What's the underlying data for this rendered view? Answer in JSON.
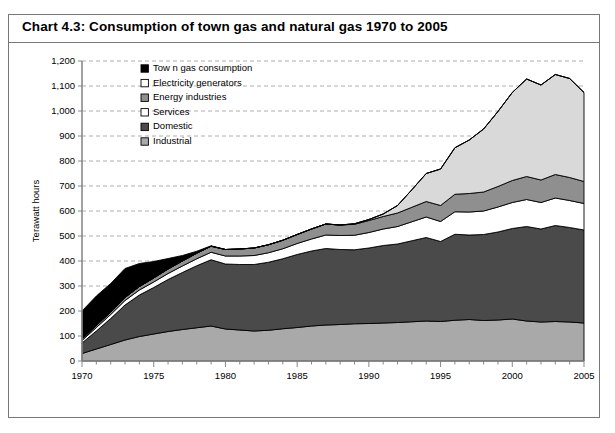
{
  "title": "Chart 4.3:  Consumption of town gas and natural gas 1970 to 2005",
  "legend": {
    "items": [
      {
        "label": "Tow n gas consumption",
        "color": "#000000",
        "name": "town-gas-consumption"
      },
      {
        "label": "Electricity generators",
        "color": "#ffffff",
        "name": "electricity-generators"
      },
      {
        "label": "Energy industries",
        "color": "#8f8f8f",
        "name": "energy-industries"
      },
      {
        "label": "Services",
        "color": "#ffffff",
        "name": "services"
      },
      {
        "label": "Domestic",
        "color": "#4a4a4a",
        "name": "domestic"
      },
      {
        "label": "Industrial",
        "color": "#a9a9a9",
        "name": "industrial"
      }
    ]
  },
  "chart_data": {
    "type": "area",
    "stacked": true,
    "title": "Chart 4.3:  Consumption of town gas and natural gas 1970 to 2005",
    "xlabel": "",
    "ylabel": "Terawatt hours",
    "ylim": [
      0,
      1200
    ],
    "ytick_step": 100,
    "yticks": [
      "0",
      "100",
      "200",
      "300",
      "400",
      "500",
      "600",
      "700",
      "800",
      "900",
      "1,000",
      "1,100",
      "1,200"
    ],
    "xlim": [
      1970,
      2005
    ],
    "xticks": [
      "1970",
      "1975",
      "1980",
      "1985",
      "1990",
      "1995",
      "2000",
      "2005"
    ],
    "xtick_step": 5,
    "grid": "horizontal-dashed",
    "legend_position": "upper-left-inside",
    "x": [
      1970,
      1971,
      1972,
      1973,
      1974,
      1975,
      1976,
      1977,
      1978,
      1979,
      1980,
      1981,
      1982,
      1983,
      1984,
      1985,
      1986,
      1987,
      1988,
      1989,
      1990,
      1991,
      1992,
      1993,
      1994,
      1995,
      1996,
      1997,
      1998,
      1999,
      2000,
      2001,
      2002,
      2003,
      2004,
      2005
    ],
    "series": [
      {
        "name": "Industrial",
        "color": "#a9a9a9",
        "stack_order": 1,
        "values": [
          30,
          48,
          66,
          84,
          98,
          108,
          118,
          126,
          133,
          140,
          128,
          124,
          120,
          123,
          129,
          134,
          140,
          144,
          146,
          149,
          150,
          152,
          154,
          157,
          160,
          158,
          163,
          166,
          162,
          164,
          168,
          160,
          156,
          158,
          156,
          152
        ]
      },
      {
        "name": "Domestic",
        "color": "#4a4a4a",
        "stack_order": 2,
        "values": [
          42,
          72,
          104,
          140,
          166,
          186,
          208,
          228,
          248,
          265,
          260,
          262,
          266,
          272,
          280,
          292,
          300,
          306,
          300,
          296,
          302,
          310,
          314,
          324,
          334,
          320,
          344,
          338,
          344,
          352,
          362,
          378,
          372,
          384,
          378,
          372
        ]
      },
      {
        "name": "Services",
        "color": "#ffffff",
        "stack_order": 3,
        "values": [
          10,
          14,
          16,
          18,
          20,
          22,
          24,
          26,
          28,
          30,
          32,
          34,
          36,
          38,
          40,
          44,
          48,
          54,
          56,
          58,
          62,
          66,
          70,
          76,
          82,
          80,
          90,
          92,
          94,
          100,
          104,
          108,
          106,
          110,
          108,
          106
        ]
      },
      {
        "name": "Energy industries",
        "color": "#8f8f8f",
        "stack_order": 4,
        "values": [
          6,
          8,
          10,
          12,
          14,
          16,
          18,
          20,
          22,
          24,
          26,
          28,
          30,
          32,
          34,
          36,
          40,
          44,
          42,
          44,
          48,
          50,
          54,
          58,
          62,
          64,
          70,
          74,
          76,
          82,
          88,
          92,
          90,
          94,
          92,
          88
        ]
      },
      {
        "name": "Electricity generators",
        "color": "#d9d9d9",
        "stack_order": 5,
        "values": [
          0,
          0,
          0,
          0,
          0,
          0,
          0,
          0,
          0,
          0,
          0,
          0,
          0,
          0,
          0,
          0,
          0,
          0,
          0,
          2,
          4,
          10,
          30,
          70,
          112,
          146,
          186,
          214,
          252,
          300,
          352,
          390,
          380,
          400,
          396,
          356
        ]
      },
      {
        "name": "Town gas consumption",
        "color": "#000000",
        "stack_order": 6,
        "values": [
          112,
          118,
          114,
          116,
          92,
          66,
          42,
          22,
          8,
          2,
          0,
          0,
          0,
          0,
          0,
          0,
          0,
          0,
          0,
          0,
          0,
          0,
          0,
          0,
          0,
          0,
          0,
          0,
          0,
          0,
          0,
          0,
          0,
          0,
          0,
          0
        ]
      }
    ]
  }
}
